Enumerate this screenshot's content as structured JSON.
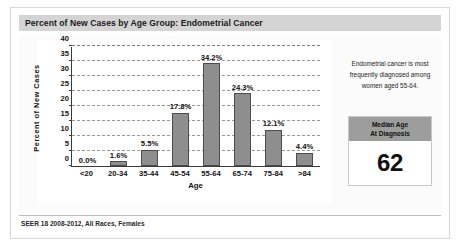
{
  "card": {
    "title": "Percent of New Cases by Age Group: Endometrial Cancer",
    "footer": "SEER 18 2008-2012, All Races, Females"
  },
  "side_panel": {
    "note": "Endometrial cancer is most frequently diagnosed among women aged 55-64.",
    "median_box": {
      "header_line1": "Median Age",
      "header_line2": "At Diagnosis",
      "value": "62"
    }
  },
  "colors": {
    "bar_fill": "#8e8e8e",
    "bar_border": "#4d4d4d",
    "title_bar": "#d4d4d4",
    "median_header": "#9d9d9d",
    "gridline": "#9a9a9a",
    "axis": "#3a3a3a"
  },
  "chart_data": {
    "type": "bar",
    "title": "Percent of New Cases by Age Group: Endometrial Cancer",
    "xlabel": "Age",
    "ylabel": "Percent of New Cases",
    "categories": [
      "<20",
      "20-34",
      "35-44",
      "45-54",
      "55-64",
      "65-74",
      "75-84",
      ">84"
    ],
    "values": [
      0.0,
      1.6,
      5.5,
      17.8,
      34.2,
      24.3,
      12.1,
      4.4
    ],
    "data_labels": [
      "0.0%",
      "1.6%",
      "5.5%",
      "17.8%",
      "34.2%",
      "24.3%",
      "12.1%",
      "4.4%"
    ],
    "ylim": [
      0,
      40
    ],
    "yticks": [
      0,
      5,
      10,
      15,
      20,
      25,
      30,
      35,
      40
    ],
    "ytick_labels": [
      "0",
      "5",
      "10",
      "15",
      "20",
      "25",
      "30",
      "35",
      "40"
    ],
    "grid": true,
    "grid_style": "dashed horizontal",
    "legend": null,
    "source": "SEER 18 2008-2012, All Races, Females"
  }
}
